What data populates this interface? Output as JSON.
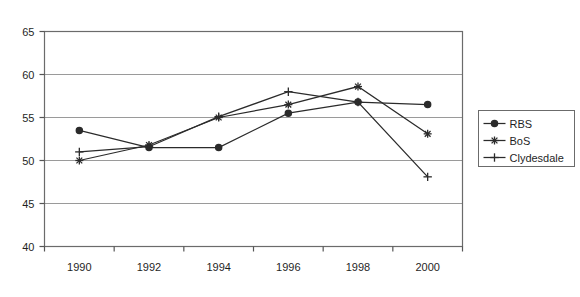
{
  "chart_data": {
    "type": "line",
    "title": "",
    "subtitle": "",
    "xlabel": "",
    "ylabel": "",
    "x": [
      1990,
      1992,
      1994,
      1996,
      1998,
      2000
    ],
    "xtick_labels": [
      "1990",
      "1992",
      "1994",
      "1996",
      "1998",
      "2000"
    ],
    "ytick_labels": [
      "65",
      "60",
      "55",
      "50",
      "45",
      "40"
    ],
    "yticks": [
      65,
      60,
      55,
      50,
      45,
      40
    ],
    "ylim": [
      40,
      65
    ],
    "grid": "horizontal",
    "legend_position": "right",
    "series": [
      {
        "name": "RBS",
        "marker": "circle",
        "color": "#2b2b2b",
        "values": [
          53.5,
          51.5,
          51.5,
          55.5,
          56.8,
          56.5
        ]
      },
      {
        "name": "BoS",
        "marker": "asterisk",
        "color": "#2b2b2b",
        "values": [
          50.0,
          51.8,
          55.0,
          56.5,
          58.6,
          53.1
        ]
      },
      {
        "name": "Clydesdale",
        "marker": "plus",
        "color": "#2b2b2b",
        "values": [
          51.0,
          51.6,
          55.1,
          58.0,
          56.8,
          48.1
        ]
      }
    ]
  },
  "legend": {
    "entries": [
      {
        "label": "RBS",
        "marker": "circle"
      },
      {
        "label": "BoS",
        "marker": "asterisk"
      },
      {
        "label": "Clydesdale",
        "marker": "plus"
      }
    ]
  },
  "colors": {
    "ink": "#2b2b2b",
    "grid": "#9a9a9a",
    "border": "#6b6b6b",
    "background": "#ffffff"
  }
}
